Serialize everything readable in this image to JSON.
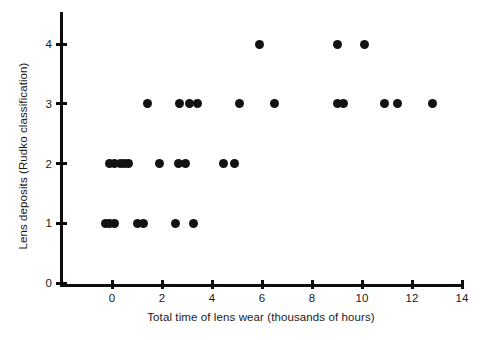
{
  "chart_data": {
    "type": "scatter",
    "title": "",
    "xlabel": "Total time of lens wear (thousands of hours)",
    "ylabel": "Lens deposits (Rudko classification)",
    "xlim": [
      -0.5,
      14
    ],
    "ylim": [
      0,
      4.4
    ],
    "grid": false,
    "legend": null,
    "xticks": [
      0,
      2,
      4,
      6,
      8,
      10,
      12,
      14
    ],
    "xtick_labels": [
      "0",
      "2",
      "4",
      "6",
      "8",
      "10",
      "12",
      "14"
    ],
    "yticks": [
      0,
      1,
      2,
      3,
      4
    ],
    "ytick_labels": [
      "0",
      "1",
      "2",
      "3",
      "4"
    ],
    "marker": "filled-circle",
    "marker_color": "#121212",
    "marker_size_px": 9,
    "points": [
      {
        "x": -0.25,
        "y": 1
      },
      {
        "x": -0.1,
        "y": 1
      },
      {
        "x": 0.1,
        "y": 1
      },
      {
        "x": 1.0,
        "y": 1
      },
      {
        "x": 1.25,
        "y": 1
      },
      {
        "x": 2.55,
        "y": 1
      },
      {
        "x": 3.25,
        "y": 1
      },
      {
        "x": -0.1,
        "y": 2
      },
      {
        "x": 0.1,
        "y": 2
      },
      {
        "x": 0.35,
        "y": 2
      },
      {
        "x": 0.5,
        "y": 2
      },
      {
        "x": 0.65,
        "y": 2
      },
      {
        "x": 1.9,
        "y": 2
      },
      {
        "x": 2.65,
        "y": 2
      },
      {
        "x": 2.95,
        "y": 2
      },
      {
        "x": 4.45,
        "y": 2
      },
      {
        "x": 4.9,
        "y": 2
      },
      {
        "x": 1.4,
        "y": 3
      },
      {
        "x": 2.7,
        "y": 3
      },
      {
        "x": 3.1,
        "y": 3
      },
      {
        "x": 3.4,
        "y": 3
      },
      {
        "x": 5.1,
        "y": 3
      },
      {
        "x": 6.5,
        "y": 3
      },
      {
        "x": 9.0,
        "y": 3
      },
      {
        "x": 9.25,
        "y": 3
      },
      {
        "x": 10.9,
        "y": 3
      },
      {
        "x": 11.4,
        "y": 3
      },
      {
        "x": 12.8,
        "y": 3
      },
      {
        "x": 5.9,
        "y": 4
      },
      {
        "x": 9.0,
        "y": 4
      },
      {
        "x": 10.1,
        "y": 4
      }
    ]
  },
  "axes_geometry": {
    "x_origin_px": 112,
    "x_unit_px": 25,
    "y_origin_px": 283,
    "y_unit_px": 59.75
  }
}
